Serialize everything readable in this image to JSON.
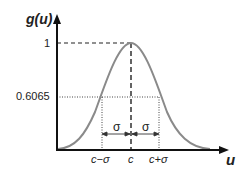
{
  "axes": {
    "y_label": "g(u)",
    "x_label": "u"
  },
  "y_ticks": [
    "1",
    "0.6065"
  ],
  "x_ticks": [
    "c−σ",
    "c",
    "c+σ"
  ],
  "annotations": {
    "sigma_left": "σ",
    "sigma_right": "σ"
  },
  "colors": {
    "curve": "#8a8a8a",
    "axis": "#111111",
    "guide": "#222222"
  }
}
